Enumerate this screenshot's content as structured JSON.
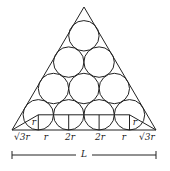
{
  "diagram": {
    "circle_rows": [
      1,
      2,
      3,
      4
    ],
    "inner_labels": [
      "r",
      "r"
    ],
    "base_labels": [
      "√3r",
      "r",
      "2r",
      "2r",
      "r",
      "√3r"
    ],
    "length_label": "L",
    "stroke_color": "#222222"
  }
}
